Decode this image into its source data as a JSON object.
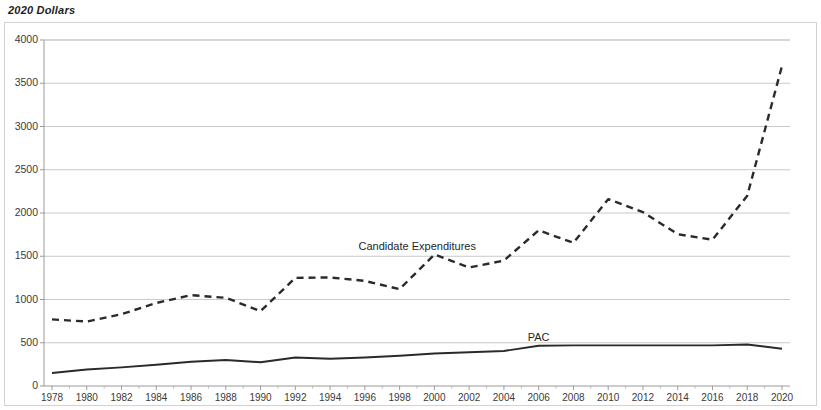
{
  "chart_data": {
    "type": "line",
    "title": "2020 Dollars",
    "xlabel": "",
    "ylabel": "",
    "ylim": [
      0,
      4000
    ],
    "ytick_step": 500,
    "grid": true,
    "legend": "inline-labels",
    "yticks": [
      "0",
      "500",
      "1000",
      "1500",
      "2000",
      "2500",
      "3000",
      "3500",
      "4000"
    ],
    "categories": [
      1978,
      1980,
      1982,
      1984,
      1986,
      1988,
      1990,
      1992,
      1994,
      1996,
      1998,
      2000,
      2002,
      2004,
      2006,
      2008,
      2010,
      2012,
      2014,
      2016,
      2018,
      2020
    ],
    "xtick_labels": [
      "1978",
      "1980",
      "1982",
      "1984",
      "1986",
      "1988",
      "1990",
      "1992",
      "1994",
      "1996",
      "1998",
      "2000",
      "2002",
      "2004",
      "2006",
      "2008",
      "2010",
      "2012",
      "2014",
      "2016",
      "2018",
      "2020"
    ],
    "series": [
      {
        "name": "Candidate Expenditures",
        "style": "dashed",
        "color": "#2a2a2a",
        "label_x_year": 1999,
        "label_value": 1610,
        "values": [
          770,
          745,
          830,
          960,
          1050,
          1020,
          865,
          1250,
          1255,
          1215,
          1120,
          1520,
          1370,
          1450,
          1800,
          1655,
          2160,
          2010,
          1755,
          1690,
          2200,
          3700
        ]
      },
      {
        "name": "PAC",
        "style": "solid",
        "color": "#2a2a2a",
        "label_x_year": 2006,
        "label_value": 560,
        "values": [
          150,
          190,
          215,
          245,
          280,
          300,
          275,
          330,
          315,
          330,
          350,
          375,
          390,
          405,
          465,
          470,
          470,
          470,
          470,
          470,
          480,
          430
        ]
      }
    ]
  }
}
